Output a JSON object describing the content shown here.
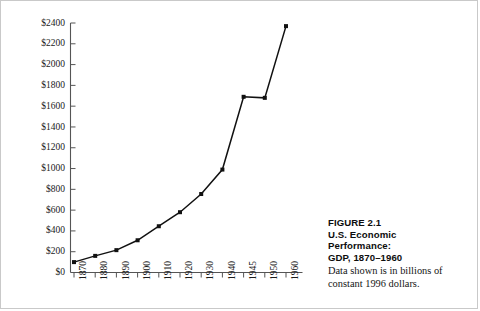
{
  "figure": {
    "caption_lines": [
      "FIGURE 2.1",
      "U.S. Economic",
      "Performance:",
      "GDP, 1870–1960"
    ],
    "note": "Data shown is in billions of constant 1996 dollars."
  },
  "chart_data": {
    "type": "line",
    "title": "U.S. Economic Performance: GDP, 1870–1960",
    "xlabel": "",
    "ylabel": "",
    "ylim": [
      0,
      2400
    ],
    "ytick_step": 200,
    "grid": false,
    "legend": "none",
    "value_prefix": "$",
    "unit_note": "billions of constant 1996 dollars",
    "categories": [
      "1870",
      "1880",
      "1890",
      "1900",
      "1910",
      "1920",
      "1930",
      "1940",
      "1945",
      "1950",
      "1960"
    ],
    "values": [
      100,
      160,
      215,
      310,
      445,
      580,
      755,
      990,
      1690,
      1680,
      2370
    ],
    "ytick_labels": [
      "$0",
      "$200",
      "$400",
      "$600",
      "$800",
      "$1000",
      "$1200",
      "$1400",
      "$1600",
      "$1800",
      "$2000",
      "$2200",
      "$2400"
    ],
    "ytick_values": [
      0,
      200,
      400,
      600,
      800,
      1000,
      1200,
      1400,
      1600,
      1800,
      2000,
      2200,
      2400
    ],
    "marker": "square",
    "line_color": "#111111",
    "marker_color": "#111111",
    "axis_color": "#555555"
  }
}
